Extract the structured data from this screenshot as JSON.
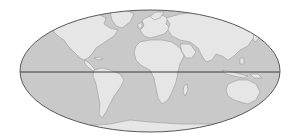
{
  "map": {
    "projection": "mollweide",
    "style": "grayscale",
    "colors": {
      "background": "#ffffff",
      "ocean": "#c9c9c9",
      "land": "#e6e6e6",
      "coastline": "#9a9a9a",
      "outline": "#5a5a5a",
      "equator": "#3c3c3c"
    },
    "features": [
      "ellipse-outline",
      "equator-line",
      "continents"
    ],
    "continents": [
      "North America",
      "South America",
      "Europe",
      "Africa",
      "Asia",
      "Australia",
      "Antarctica",
      "Greenland"
    ]
  }
}
